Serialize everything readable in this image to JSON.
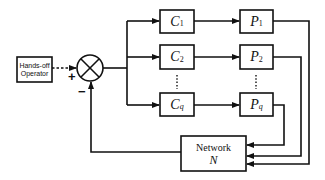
{
  "diagram": {
    "type": "block-diagram",
    "operator": {
      "label": "Hands-off Operator"
    },
    "summing_junction": {
      "plus_sign": "+",
      "minus_sign": "−"
    },
    "controllers": [
      {
        "symbol": "C",
        "subscript": "1"
      },
      {
        "symbol": "C",
        "subscript": "2"
      },
      {
        "symbol": "C",
        "subscript": "q"
      }
    ],
    "plants": [
      {
        "symbol": "P",
        "subscript": "1"
      },
      {
        "symbol": "P",
        "subscript": "2"
      },
      {
        "symbol": "P",
        "subscript": "q"
      }
    ],
    "ellipsis": "⋮",
    "network": {
      "label": "Network",
      "symbol": "N"
    },
    "colors": {
      "stroke": "#111111",
      "background": "#ffffff"
    }
  }
}
